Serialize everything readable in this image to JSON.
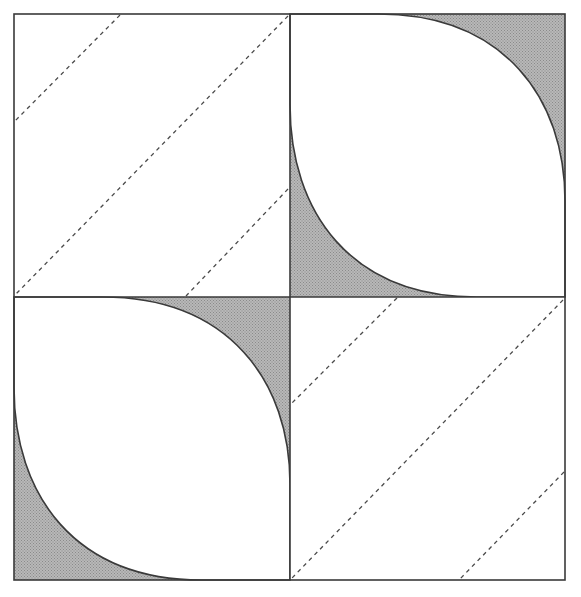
{
  "diagram": {
    "title": "Quilt block: four-patch with leaf (drunkard's-path style) curves and diagonal dashed quilting lines",
    "colors": {
      "background": "#ffffff",
      "stroke": "#3a3a3a",
      "fill": "#b8b8b8",
      "fill_dot": "#8a8a8a",
      "dash": "#4a4a4a"
    },
    "block": {
      "x": 14,
      "y": 14,
      "width": 551,
      "height": 566
    },
    "center": {
      "x": 290,
      "y": 297
    },
    "quadrants": [
      {
        "id": "top-left",
        "type": "plain-dashed",
        "x": 14,
        "y": 14,
        "w": 276,
        "h": 283,
        "dashed_lines": [
          {
            "x1": 120,
            "y1": 15,
            "x2": 14,
            "y2": 122
          },
          {
            "x1": 288,
            "y1": 16,
            "x2": 15,
            "y2": 295
          },
          {
            "x1": 288,
            "y1": 189,
            "x2": 186,
            "y2": 296
          }
        ]
      },
      {
        "id": "top-right",
        "type": "leaf",
        "x": 290,
        "y": 14,
        "w": 275,
        "h": 283
      },
      {
        "id": "bottom-left",
        "type": "leaf",
        "x": 14,
        "y": 297,
        "w": 276,
        "h": 283
      },
      {
        "id": "bottom-right",
        "type": "plain-dashed",
        "x": 290,
        "y": 297,
        "w": 275,
        "h": 283,
        "dashed_lines": [
          {
            "x1": 397,
            "y1": 298,
            "x2": 291,
            "y2": 404
          },
          {
            "x1": 563,
            "y1": 300,
            "x2": 292,
            "y2": 578
          },
          {
            "x1": 564,
            "y1": 472,
            "x2": 460,
            "y2": 579
          }
        ]
      }
    ]
  }
}
